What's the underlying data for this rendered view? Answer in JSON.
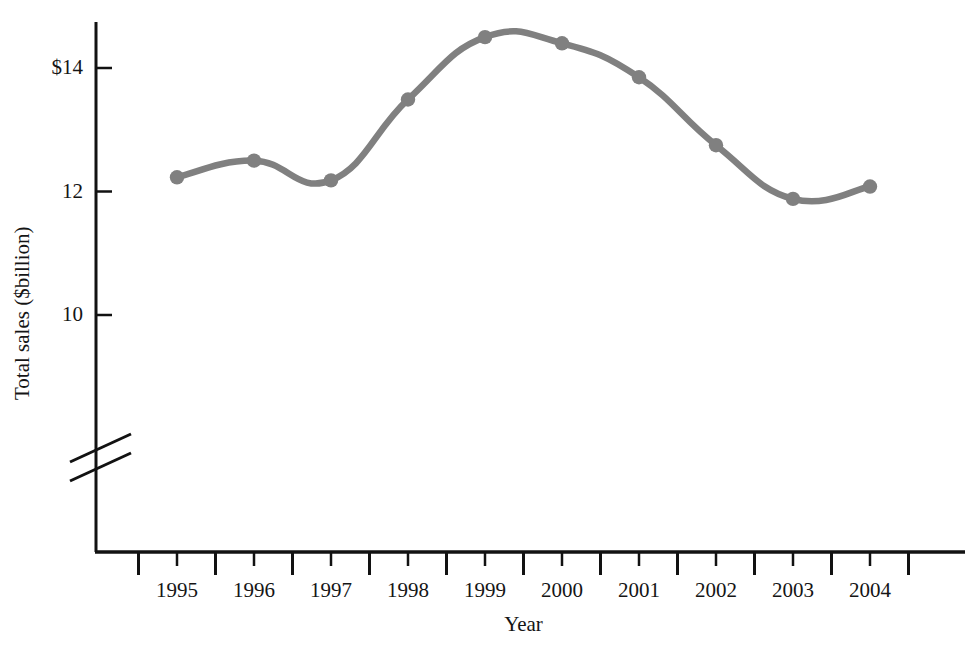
{
  "chart_data": {
    "type": "line",
    "title": "",
    "subtitle": "",
    "xlabel": "Year",
    "ylabel": "Total sales ($billion)",
    "categories": [
      "1995",
      "1996",
      "1997",
      "1998",
      "1999",
      "2000",
      "2001",
      "2002",
      "2003",
      "2004"
    ],
    "x": [
      1995,
      1996,
      1997,
      1998,
      1999,
      2000,
      2001,
      2002,
      2003,
      2004
    ],
    "values": [
      12.23,
      12.5,
      12.18,
      13.49,
      14.5,
      14.4,
      13.85,
      12.75,
      11.88,
      12.08
    ],
    "series": [
      {
        "name": "Total sales",
        "values": [
          12.23,
          12.5,
          12.18,
          13.49,
          14.5,
          14.4,
          13.85,
          12.75,
          11.88,
          12.08
        ]
      }
    ],
    "ylim": [
      11.0,
      14.85
    ],
    "xlim": [
      1994.5,
      2004.85
    ],
    "y_tick_labels": [
      "$14",
      "12",
      "10"
    ],
    "y_tick_values": [
      14,
      12,
      10
    ],
    "x_tick_labels": [
      "1995",
      "1996",
      "1997",
      "1998",
      "1999",
      "2000",
      "2001",
      "2002",
      "2003",
      "2004"
    ],
    "grid": false,
    "legend": false,
    "legend_position": "none",
    "axis_break": true,
    "axis_break_note": "y-axis broken below 10",
    "smoothing": "spline",
    "marker": "circle",
    "annotations": []
  },
  "style": {
    "series_color": "#808080",
    "axis_color": "#121212",
    "text_color": "#151515",
    "background": "#ffffff",
    "marker_color": "#808080"
  },
  "axis_labels": {
    "y": "Total sales ($billion)",
    "x": "Year"
  },
  "y_ticks": [
    {
      "label": "$14",
      "value": 14
    },
    {
      "label": "12",
      "value": 12
    },
    {
      "label": "10",
      "value": 10
    }
  ],
  "x_ticks": [
    {
      "label": "1995",
      "value": 1995
    },
    {
      "label": "1996",
      "value": 1996
    },
    {
      "label": "1997",
      "value": 1997
    },
    {
      "label": "1998",
      "value": 1998
    },
    {
      "label": "1999",
      "value": 1999
    },
    {
      "label": "2000",
      "value": 2000
    },
    {
      "label": "2001",
      "value": 2001
    },
    {
      "label": "2002",
      "value": 2002
    },
    {
      "label": "2003",
      "value": 2003
    },
    {
      "label": "2004",
      "value": 2004
    }
  ]
}
